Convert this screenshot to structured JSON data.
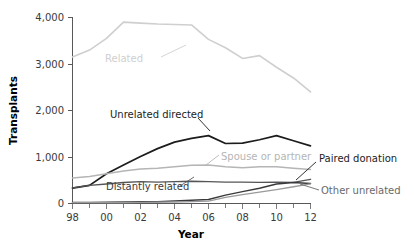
{
  "chart_data": {
    "type": "line",
    "title": "",
    "xlabel": "Year",
    "ylabel": "Transplants",
    "x": [
      1998,
      1999,
      2000,
      2001,
      2002,
      2003,
      2004,
      2005,
      2006,
      2007,
      2008,
      2009,
      2010,
      2011,
      2012
    ],
    "xtick_labels": [
      "98",
      "00",
      "02",
      "04",
      "06",
      "08",
      "10",
      "12"
    ],
    "xtick_values": [
      1998,
      2000,
      2002,
      2004,
      2006,
      2008,
      2010,
      2012
    ],
    "ytick_labels": [
      "0",
      "1,000",
      "2,000",
      "3,000",
      "4,000"
    ],
    "ytick_values": [
      0,
      1000,
      2000,
      3000,
      4000
    ],
    "xlim": [
      1998,
      2012
    ],
    "ylim": [
      0,
      4000
    ],
    "grid": false,
    "legend": "inline-annotations",
    "series": [
      {
        "name": "Related",
        "color": "#cfcfcf",
        "width": 1.6,
        "values": [
          3150,
          3300,
          3550,
          3900,
          3880,
          3860,
          3850,
          3840,
          3530,
          3350,
          3120,
          3180,
          2930,
          2700,
          2400
        ]
      },
      {
        "name": "Unrelated directed",
        "color": "#1c1c1c",
        "width": 1.7,
        "values": [
          330,
          390,
          640,
          830,
          1010,
          1180,
          1320,
          1400,
          1460,
          1290,
          1300,
          1370,
          1460,
          1350,
          1240
        ]
      },
      {
        "name": "Spouse or partner",
        "color": "#b5b5b5",
        "width": 1.5,
        "values": [
          550,
          580,
          640,
          700,
          740,
          760,
          790,
          820,
          830,
          790,
          770,
          790,
          790,
          760,
          730
        ]
      },
      {
        "name": "Distantly related",
        "color": "#555557",
        "width": 1.4,
        "values": [
          335,
          390,
          420,
          450,
          470,
          460,
          470,
          480,
          470,
          460,
          460,
          455,
          460,
          455,
          520
        ]
      },
      {
        "name": "Paired donation",
        "color": "#3a3a3c",
        "width": 1.5,
        "values": [
          20,
          20,
          25,
          30,
          35,
          40,
          55,
          70,
          85,
          180,
          255,
          330,
          420,
          450,
          430
        ]
      },
      {
        "name": "Other unrelated",
        "color": "#9a9a9c",
        "width": 1.3,
        "values": [
          18,
          18,
          20,
          22,
          25,
          28,
          32,
          40,
          50,
          130,
          190,
          245,
          300,
          360,
          420
        ]
      }
    ],
    "annotations": [
      {
        "text": "Related",
        "color": "#cfcfcf"
      },
      {
        "text": "Unrelated directed",
        "color": "#1c1c1c"
      },
      {
        "text": "Spouse or partner",
        "color": "#b5b5b5"
      },
      {
        "text": "Distantly related",
        "color": "#3a3a3c"
      },
      {
        "text": "Paired donation",
        "color": "#1c1c1c"
      },
      {
        "text": "Other unrelated",
        "color": "#6a6a6c"
      }
    ]
  },
  "axes": {
    "ylabel": "Transplants",
    "xlabel": "Year",
    "ytick_0": "0",
    "ytick_1": "1,000",
    "ytick_2": "2,000",
    "ytick_3": "3,000",
    "ytick_4": "4,000",
    "xtick_0": "98",
    "xtick_1": "00",
    "xtick_2": "02",
    "xtick_3": "04",
    "xtick_4": "06",
    "xtick_5": "08",
    "xtick_6": "10",
    "xtick_7": "12"
  },
  "labels": {
    "related": "Related",
    "unrelated_directed": "Unrelated directed",
    "spouse_or_partner": "Spouse or partner",
    "distantly_related": "Distantly related",
    "paired_donation": "Paired donation",
    "other_unrelated": "Other unrelated"
  }
}
